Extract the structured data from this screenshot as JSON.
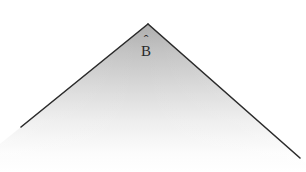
{
  "figure": {
    "background_color": "#ffffff",
    "edge_color": "#2b2b2b",
    "edge_width_px": 1.6,
    "shading": {
      "description": "gray gradient filling the region beneath the apex, fading to white toward the bottom",
      "top_color": "#b4b4b4",
      "mid_color": "#d6d6d6",
      "bottom_color": "#ffffff"
    },
    "apex": {
      "x": 148,
      "y": 24
    },
    "left_endpoint": {
      "x": 21,
      "y": 127
    },
    "right_endpoint": {
      "x": 300,
      "y": 158
    },
    "labels": [
      {
        "name": "apex-label",
        "base": "B",
        "accent": "ˆ",
        "full_text": "B̂",
        "x": 141,
        "y": 44
      }
    ]
  }
}
